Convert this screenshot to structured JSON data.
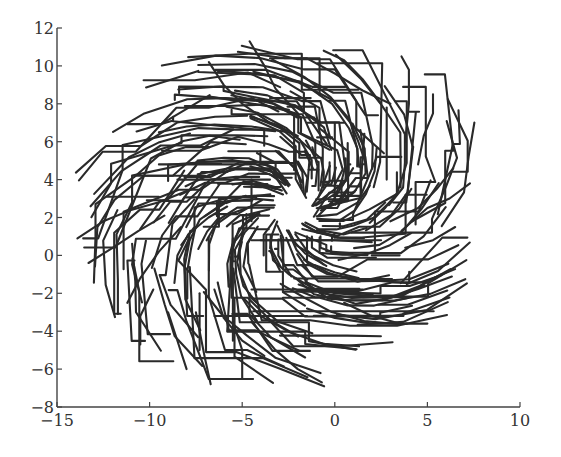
{
  "chart_data": {
    "type": "line",
    "title": "",
    "xlabel": "",
    "ylabel": "",
    "xlim": [
      -15,
      10
    ],
    "ylim": [
      -8,
      12
    ],
    "x_ticks": [
      -15,
      -10,
      -5,
      0,
      5,
      10
    ],
    "x_tick_labels": [
      "−15",
      "−10",
      "−5",
      "0",
      "5",
      "10"
    ],
    "y_ticks": [
      -8,
      -6,
      -4,
      -2,
      0,
      2,
      4,
      6,
      8,
      10,
      12
    ],
    "y_tick_labels": [
      "−8",
      "−6",
      "−4",
      "−2",
      "0",
      "2",
      "4",
      "6",
      "8",
      "10",
      "12"
    ],
    "grid": false,
    "legend": null,
    "axes_style": "left and bottom spines only",
    "line_color": "#2a2a2a",
    "arms": [
      {
        "name": "arm-upper",
        "center_region": [
          -2,
          7
        ],
        "tip_region": [
          -5,
          11
        ]
      },
      {
        "name": "arm-right",
        "center_region": [
          3,
          4
        ],
        "tip_region": [
          5,
          10.5
        ]
      },
      {
        "name": "arm-lower-right",
        "center_region": [
          3,
          0
        ],
        "tip_region": [
          7.3,
          3.8
        ]
      },
      {
        "name": "arm-lower",
        "center_region": [
          -3,
          -3
        ],
        "tip_region": [
          5,
          -3.5
        ]
      },
      {
        "name": "arm-left",
        "center_region": [
          -9,
          2
        ],
        "tip_region": [
          -14,
          0.9
        ]
      }
    ],
    "sample_trajectories": [
      [
        [
          -13.9,
          0.9
        ],
        [
          -12.5,
          1.8
        ],
        [
          -11,
          2.4
        ],
        [
          -9.5,
          2.8
        ],
        [
          -8,
          3.4
        ]
      ],
      [
        [
          -13.3,
          -0.4
        ],
        [
          -12,
          0.4
        ],
        [
          -10.6,
          1.3
        ],
        [
          -9.2,
          2.1
        ]
      ],
      [
        [
          -11.2,
          -2.5
        ],
        [
          -10.5,
          -1.2
        ],
        [
          -9.5,
          0.2
        ],
        [
          -8.3,
          1.5
        ]
      ],
      [
        [
          -10.5,
          -4.7
        ],
        [
          -10.5,
          -3.2
        ],
        [
          -9.8,
          -1.8
        ]
      ],
      [
        [
          -9.5,
          6.5
        ],
        [
          -8,
          6.8
        ],
        [
          -6.5,
          6.9
        ],
        [
          -4.5,
          6.8
        ],
        [
          -2.5,
          6.5
        ]
      ],
      [
        [
          -6.8,
          10.2
        ],
        [
          -6,
          9
        ],
        [
          -5,
          8
        ],
        [
          -3.5,
          7
        ],
        [
          -2,
          6.3
        ]
      ],
      [
        [
          -4.6,
          11.3
        ],
        [
          -3.8,
          10
        ],
        [
          -3.2,
          8.8
        ],
        [
          -2,
          7.5
        ]
      ],
      [
        [
          -3.5,
          10.4
        ],
        [
          -1.5,
          10.4
        ],
        [
          0,
          9.6
        ],
        [
          1.5,
          8.7
        ],
        [
          3,
          8
        ]
      ],
      [
        [
          -0.6,
          10.8
        ],
        [
          0.5,
          10.3
        ],
        [
          1.5,
          9.3
        ],
        [
          2.5,
          8
        ]
      ],
      [
        [
          3.6,
          10.5
        ],
        [
          4,
          9.8
        ],
        [
          4,
          8
        ],
        [
          3.8,
          6
        ]
      ],
      [
        [
          5.3,
          8.5
        ],
        [
          5.3,
          7.5
        ],
        [
          4.8,
          6.3
        ],
        [
          4.5,
          4.8
        ]
      ],
      [
        [
          6.4,
          4.6
        ],
        [
          5.5,
          3.5
        ],
        [
          4.5,
          2.5
        ],
        [
          3,
          1.8
        ]
      ],
      [
        [
          7.3,
          3.8
        ],
        [
          6.2,
          3
        ],
        [
          5,
          2.5
        ],
        [
          3.6,
          1.3
        ]
      ],
      [
        [
          6.5,
          1.5
        ],
        [
          5.3,
          0.8
        ],
        [
          3.8,
          0.4
        ]
      ],
      [
        [
          5,
          -3.6
        ],
        [
          3.5,
          -3.6
        ],
        [
          2,
          -3.2
        ],
        [
          0.5,
          -2.5
        ]
      ],
      [
        [
          3.9,
          -3.6
        ],
        [
          2,
          -3.6
        ],
        [
          0,
          -3.3
        ],
        [
          -1.5,
          -2.8
        ]
      ],
      [
        [
          -0.7,
          -6.7
        ],
        [
          -2,
          -6
        ],
        [
          -3.2,
          -5
        ],
        [
          -4.5,
          -3.5
        ]
      ],
      [
        [
          -3.8,
          -5.3
        ],
        [
          -5,
          -4.5
        ],
        [
          -6,
          -3.3
        ],
        [
          -6.5,
          -1.8
        ]
      ],
      [
        [
          -5,
          -6.5
        ],
        [
          -5,
          -5
        ],
        [
          -5.5,
          -3.5
        ]
      ],
      [
        [
          -6.7,
          -6.8
        ],
        [
          -7,
          -5.5
        ],
        [
          -7.2,
          -4.5
        ],
        [
          -7.5,
          -3
        ]
      ],
      [
        [
          -8,
          -6
        ],
        [
          -8.5,
          -4.5
        ],
        [
          -9,
          -3
        ]
      ],
      [
        [
          -4.5,
          0.8
        ],
        [
          -2,
          0.8
        ],
        [
          0,
          0.8
        ],
        [
          2,
          0.7
        ]
      ]
    ]
  }
}
